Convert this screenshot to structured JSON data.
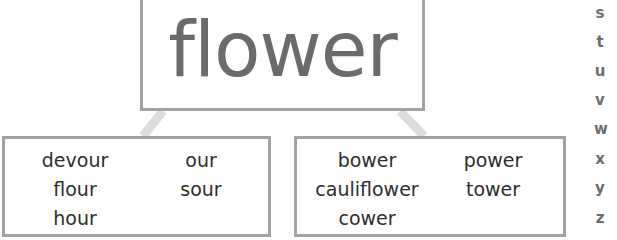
{
  "diagram": {
    "root_word": "flower",
    "groups": [
      {
        "name": "our-spelling",
        "words": [
          "devour",
          "flour",
          "hour",
          "our",
          "sour"
        ]
      },
      {
        "name": "ower-spelling",
        "words": [
          "bower",
          "cauliflower",
          "cower",
          "power",
          "tower"
        ]
      }
    ]
  },
  "alphabet_index": [
    "s",
    "t",
    "u",
    "v",
    "w",
    "x",
    "y",
    "z"
  ],
  "colors": {
    "border": "#a3a3a3",
    "connector": "#dcdcdc",
    "title_text": "#6b6b6b",
    "word_text": "#2e2e2e"
  }
}
